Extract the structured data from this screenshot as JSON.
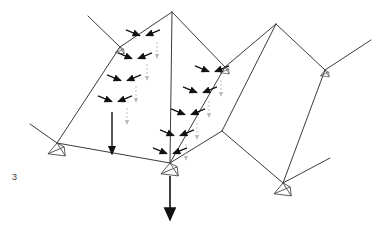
{
  "figure": {
    "label": "3",
    "title": "",
    "type": "structural-load-diagram",
    "colors": {
      "line": "#3b3b3b",
      "arrow": "#111111",
      "ghost_arrow": "#b9b9b9",
      "support": "#4a4a4a",
      "background": "#ffffff",
      "label_text": "#3a3a3a"
    },
    "line_width": 1.0
  },
  "geometry": {
    "nodes": [
      {
        "name": "apex-left",
        "x": 172,
        "y": 12
      },
      {
        "name": "apex-right",
        "x": 276,
        "y": 24
      },
      {
        "name": "ridge-node-left",
        "x": 120,
        "y": 47
      },
      {
        "name": "ridge-node-mid",
        "x": 225,
        "y": 67
      },
      {
        "name": "ridge-node-right",
        "x": 325,
        "y": 70
      },
      {
        "name": "support-left",
        "x": 57,
        "y": 143
      },
      {
        "name": "support-center",
        "x": 170,
        "y": 163
      },
      {
        "name": "support-right",
        "x": 283,
        "y": 183
      },
      {
        "name": "valley-node",
        "x": 222,
        "y": 131
      },
      {
        "name": "eave-far-left",
        "x": 33,
        "y": 117
      },
      {
        "name": "tip-upper-left",
        "x": 88,
        "y": 16
      },
      {
        "name": "tip-far-right",
        "x": 371,
        "y": 40
      },
      {
        "name": "tip-lower-left",
        "x": 30,
        "y": 124
      },
      {
        "name": "tip-lower-right",
        "x": 330,
        "y": 158
      },
      {
        "name": "tip-right-node",
        "x": 352,
        "y": 88
      }
    ],
    "members": [
      {
        "name": "ridge-left-upper",
        "from": "ridge-node-left",
        "to": "apex-left"
      },
      {
        "name": "ridge-left-lower",
        "from": "ridge-node-left",
        "to": "support-left"
      },
      {
        "name": "hip-left-tip",
        "from": "ridge-node-left",
        "to": "tip-upper-left"
      },
      {
        "name": "valley-left",
        "from": "apex-left",
        "to": "support-center"
      },
      {
        "name": "eave-left",
        "from": "support-left",
        "to": "support-center"
      },
      {
        "name": "eave-left-tip",
        "from": "support-left",
        "to": "tip-lower-left"
      },
      {
        "name": "ridge-mid-upper",
        "from": "apex-left",
        "to": "ridge-node-mid"
      },
      {
        "name": "ridge-mid-lower",
        "from": "ridge-node-mid",
        "to": "support-center"
      },
      {
        "name": "hip-mid-right",
        "from": "ridge-node-mid",
        "to": "apex-right"
      },
      {
        "name": "valley-mid",
        "from": "apex-right",
        "to": "valley-node"
      },
      {
        "name": "eave-mid",
        "from": "valley-node",
        "to": "support-center"
      },
      {
        "name": "eave-right",
        "from": "valley-node",
        "to": "support-right"
      },
      {
        "name": "ridge-right-upper",
        "from": "apex-right",
        "to": "ridge-node-right"
      },
      {
        "name": "ridge-right-lower",
        "from": "ridge-node-right",
        "to": "support-right"
      },
      {
        "name": "hip-right-tip",
        "from": "ridge-node-right",
        "to": "tip-far-right"
      },
      {
        "name": "eave-right-tip",
        "from": "support-right",
        "to": "tip-lower-right"
      }
    ]
  },
  "loads": {
    "ridge_a": {
      "name": "ridge-load-group-left",
      "along": [
        "apex-left",
        "support-center"
      ],
      "count": 5,
      "arrow_pairs": [
        {
          "x": 143,
          "y": 37
        },
        {
          "x": 135,
          "y": 60
        },
        {
          "x": 124,
          "y": 82
        },
        {
          "x": 115,
          "y": 103
        },
        {
          "x": 170,
          "y": 155
        }
      ],
      "ghost_arrows": [
        {
          "x": 157,
          "y": 42
        },
        {
          "x": 147,
          "y": 64
        },
        {
          "x": 136,
          "y": 86
        },
        {
          "x": 127,
          "y": 108
        }
      ]
    },
    "ridge_b": {
      "name": "ridge-load-group-right",
      "along": [
        "ridge-node-mid",
        "support-center"
      ],
      "count": 4,
      "arrow_pairs": [
        {
          "x": 212,
          "y": 73
        },
        {
          "x": 200,
          "y": 94
        },
        {
          "x": 188,
          "y": 116
        },
        {
          "x": 177,
          "y": 137
        }
      ],
      "ghost_arrows": [
        {
          "x": 221,
          "y": 80
        },
        {
          "x": 209,
          "y": 101
        },
        {
          "x": 197,
          "y": 123
        },
        {
          "x": 186,
          "y": 144
        }
      ]
    },
    "point_loads": [
      {
        "name": "vertical-load-left",
        "x": 112,
        "y": 112,
        "length": 42,
        "head": "medium"
      },
      {
        "name": "vertical-load-center",
        "x": 170,
        "y": 176,
        "length": 44,
        "head": "large"
      }
    ]
  },
  "supports": [
    {
      "name": "support-symbol-left",
      "x": 57,
      "y": 143,
      "size": "large"
    },
    {
      "name": "support-symbol-center",
      "x": 170,
      "y": 163,
      "size": "large"
    },
    {
      "name": "support-symbol-right",
      "x": 283,
      "y": 183,
      "size": "large"
    },
    {
      "name": "support-symbol-ridge-left",
      "x": 120,
      "y": 47,
      "size": "small"
    },
    {
      "name": "support-symbol-ridge-mid",
      "x": 225,
      "y": 67,
      "size": "small"
    },
    {
      "name": "support-symbol-ridge-right",
      "x": 325,
      "y": 70,
      "size": "small"
    }
  ]
}
